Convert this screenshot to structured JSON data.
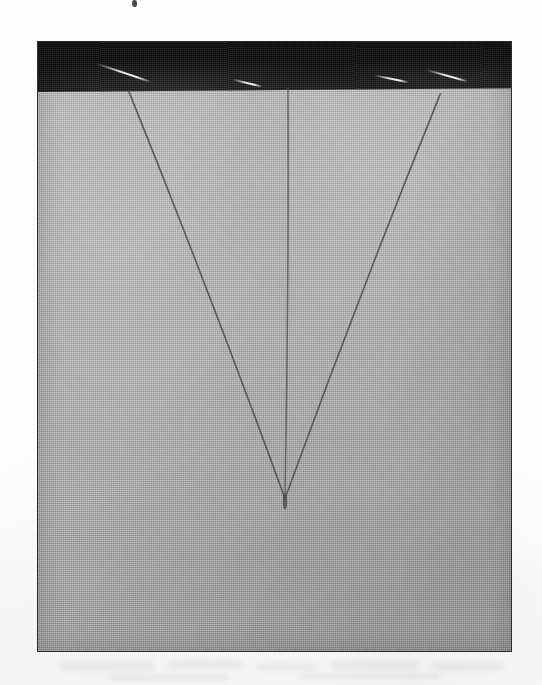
{
  "image": {
    "kind": "scanned-photograph",
    "subject": "woven fabric specimen with three converging dark threads forming a V",
    "caption": "",
    "plate": {
      "x": 37,
      "y": 41,
      "width": 475,
      "height": 611,
      "border_color": "#2e2e2e"
    },
    "page_background_color": "#fdfdfd"
  },
  "regions": {
    "dark_band": {
      "label": "dark upper band",
      "color": "#161616",
      "top": 0,
      "height": 48,
      "tilt_degrees": -0.45
    },
    "fabric": {
      "label": "light grey woven cloth",
      "color": "#a7a7a7",
      "highlight_color": "#b6b6b6",
      "shadow_color": "#8f8f8f"
    }
  },
  "threads": [
    {
      "name": "left-thread",
      "color": "#4d4d4d",
      "x1": 91,
      "y1": 49,
      "x2": 248,
      "y2": 458,
      "width": 1.6
    },
    {
      "name": "center-thread",
      "color": "#5a5a5a",
      "x1": 251,
      "y1": 47,
      "x2": 248,
      "y2": 458,
      "width": 1.5
    },
    {
      "name": "right-thread",
      "color": "#4d4d4d",
      "x1": 404,
      "y1": 52,
      "x2": 248,
      "y2": 458,
      "width": 1.6
    }
  ],
  "convergence_point": {
    "label": "apex where the three threads meet",
    "x": 248,
    "y": 458
  },
  "streaks": [
    {
      "name": "streak-1",
      "left": 60,
      "top": 23,
      "length": 56,
      "angle": 19
    },
    {
      "name": "streak-2",
      "left": 196,
      "top": 40,
      "length": 30,
      "angle": 14
    },
    {
      "name": "streak-3",
      "left": 338,
      "top": 37,
      "length": 34,
      "angle": 12
    },
    {
      "name": "streak-4",
      "left": 390,
      "top": 32,
      "length": 42,
      "angle": 16
    }
  ],
  "bleed_marks": [
    {
      "name": "bleed-1",
      "left": 58,
      "top": 662,
      "width": 96,
      "height": 9
    },
    {
      "name": "bleed-2",
      "left": 168,
      "top": 660,
      "width": 74,
      "height": 10
    },
    {
      "name": "bleed-3",
      "left": 258,
      "top": 663,
      "width": 58,
      "height": 8
    },
    {
      "name": "bleed-4",
      "left": 330,
      "top": 661,
      "width": 88,
      "height": 9
    },
    {
      "name": "bleed-5",
      "left": 432,
      "top": 662,
      "width": 72,
      "height": 9
    },
    {
      "name": "bleed-6",
      "left": 110,
      "top": 674,
      "width": 120,
      "height": 7
    },
    {
      "name": "bleed-7",
      "left": 300,
      "top": 673,
      "width": 140,
      "height": 7
    }
  ],
  "speck": {
    "name": "ink-speck",
    "left": 132,
    "top": 0
  }
}
